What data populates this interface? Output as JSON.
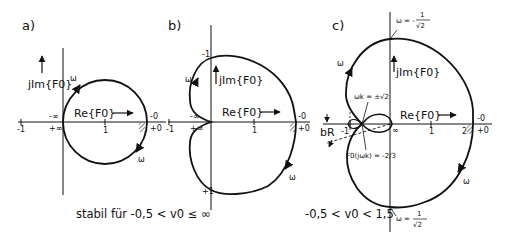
{
  "figure": {
    "panels": [
      {
        "id": "a",
        "label": "a)",
        "axis_re": "Re{F0}",
        "axis_im": "jIm{F0}",
        "ticks": {
          "minus_one": "-1",
          "one": "1"
        },
        "point_labels": {
          "minus_inf": "-∞",
          "plus_inf": "+∞",
          "minus_zero": "-0",
          "plus_zero": "+0"
        },
        "omega_labels": [
          "ω",
          "ω"
        ],
        "shape": "circle"
      },
      {
        "id": "b",
        "label": "b)",
        "axis_re": "Re{F0}",
        "axis_im": "jIm{F0}",
        "ticks": {
          "minus_one": "-1",
          "one": "1",
          "im_top": "-1",
          "im_bottom": "+1"
        },
        "point_labels": {
          "minus_inf": "-∞",
          "plus_inf": "+∞",
          "minus_zero": "-0",
          "plus_zero": "+0"
        },
        "omega_labels": [
          "ω",
          "ω"
        ],
        "shape": "cardioid"
      },
      {
        "id": "c",
        "label": "c)",
        "axis_re": "Re{F0}",
        "axis_im": "jIm{F0}",
        "ticks": {
          "minus_one": "-1",
          "one": "1",
          "two": "2"
        },
        "point_labels": {
          "inf": "∞",
          "minus_zero": "-0",
          "plus_zero": "+0"
        },
        "omega_labels": [
          "ω",
          "ω"
        ],
        "annotations": {
          "omega_top": {
            "prefix": "ω = -",
            "num": "1",
            "den": "√2"
          },
          "omega_bottom": {
            "prefix": "ω = ",
            "num": "1",
            "den": "√2"
          },
          "omega_crossing": "ωk = ±√2",
          "f_crossing": "F0(jωk) = -2/3",
          "margin_label": "bR"
        },
        "shape": "cardioid-with-inner-loop"
      }
    ],
    "captions": {
      "ab": "stabil für  -0,5 < v0 ≤ ∞",
      "c": "-0,5 < v0 < 1,5"
    }
  }
}
